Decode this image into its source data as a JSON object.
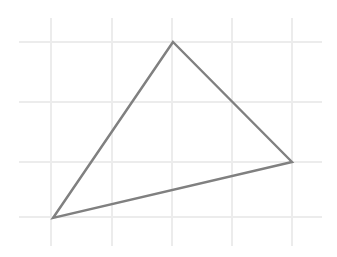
{
  "figure": {
    "canvas": {
      "width": 337,
      "height": 257,
      "background": "#ffffff"
    },
    "grid": {
      "visible": true,
      "color": "#ececec",
      "stroke_width": 1.6,
      "vertical_lines_x": [
        51,
        112,
        172,
        232,
        292
      ],
      "vertical_extent_y": [
        18,
        246
      ],
      "horizontal_lines_y": [
        42,
        102,
        162,
        217
      ],
      "horizontal_extent_x": [
        19,
        322
      ],
      "spacing_x": 60,
      "spacing_y": 60
    },
    "shape": {
      "name": "triangle",
      "kind": "scalene",
      "stroke_color": "#808080",
      "stroke_width": 2.4,
      "fill": "none",
      "closed": true,
      "vertices": [
        {
          "label": "apex",
          "x": 173,
          "y": 42
        },
        {
          "label": "right",
          "x": 292,
          "y": 162
        },
        {
          "label": "bottom-left",
          "x": 53,
          "y": 218
        }
      ],
      "points_attr": "173,42 292,162 53,218"
    }
  }
}
